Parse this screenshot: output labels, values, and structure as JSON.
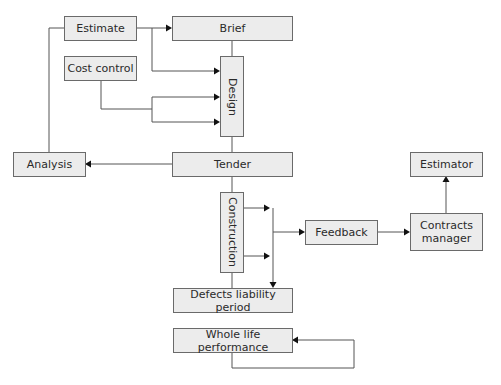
{
  "diagram": {
    "type": "flowchart",
    "colors": {
      "node_fill": "#ececec",
      "node_border": "#6a6a6a",
      "edge": "#555555",
      "text": "#2a2a2a"
    },
    "nodes": {
      "estimate": {
        "label": "Estimate"
      },
      "brief": {
        "label": "Brief"
      },
      "cost_control": {
        "label": "Cost control"
      },
      "design": {
        "label": "Design"
      },
      "analysis": {
        "label": "Analysis"
      },
      "tender": {
        "label": "Tender"
      },
      "construction": {
        "label": "Construction"
      },
      "defects": {
        "label": "Defects liability period"
      },
      "feedback": {
        "label": "Feedback"
      },
      "estimator": {
        "label": "Estimator"
      },
      "contracts_manager": {
        "label": "Contracts manager"
      },
      "whole_life": {
        "label": "Whole life performance"
      }
    },
    "edges": [
      {
        "from": "Estimate",
        "to": "Brief"
      },
      {
        "from": "Estimate",
        "to": "Design"
      },
      {
        "from": "Cost control",
        "to": "Design"
      },
      {
        "from": "Cost control",
        "to": "Design"
      },
      {
        "from": "Brief",
        "to": "Design"
      },
      {
        "from": "Design",
        "to": "Tender"
      },
      {
        "from": "Tender",
        "to": "Analysis"
      },
      {
        "from": "Analysis",
        "to": "Estimate"
      },
      {
        "from": "Tender",
        "to": "Construction"
      },
      {
        "from": "Construction",
        "to": "Feedback"
      },
      {
        "from": "Construction",
        "to": "Defects liability period"
      },
      {
        "from": "Feedback",
        "to": "Contracts manager"
      },
      {
        "from": "Contracts manager",
        "to": "Estimator"
      },
      {
        "from": "Whole life performance",
        "to": "Whole life performance"
      }
    ]
  }
}
